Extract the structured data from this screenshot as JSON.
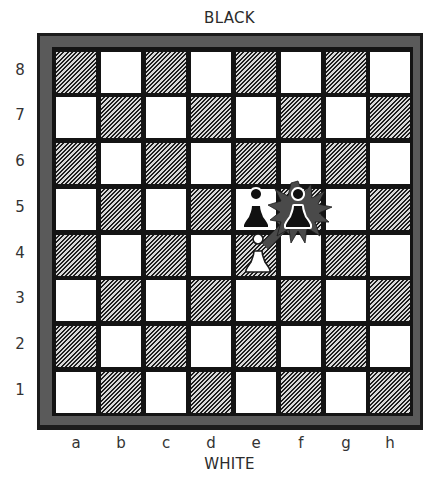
{
  "labels": {
    "top": "BLACK",
    "bottom": "WHITE"
  },
  "ranks": [
    "8",
    "7",
    "6",
    "5",
    "4",
    "3",
    "2",
    "1"
  ],
  "files": [
    "a",
    "b",
    "c",
    "d",
    "e",
    "f",
    "g",
    "h"
  ],
  "board": {
    "orientation": "white-bottom",
    "a1_color": "dark",
    "light_color": "#ffffff",
    "dark_style": "diagonal-hatch",
    "frame_color": "#5a5a5a",
    "border_color": "#1c1c1c"
  },
  "pieces": [
    {
      "square": "e5",
      "color": "black",
      "type": "pawn",
      "icon": "black-pawn-icon"
    },
    {
      "square": "f5",
      "color": "black",
      "type": "pawn",
      "icon": "black-pawn-icon",
      "highlight": "capture-burst"
    },
    {
      "square": "e4",
      "color": "white",
      "type": "pawn",
      "icon": "white-pawn-icon"
    }
  ],
  "annotations": [
    {
      "type": "capture-arrow",
      "from": "e4",
      "to": "f5",
      "color": "#4a4a4a"
    },
    {
      "type": "burst",
      "square": "f5",
      "color": "#4a4a4a"
    }
  ]
}
